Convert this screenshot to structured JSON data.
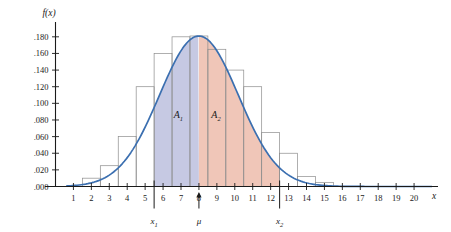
{
  "figure": {
    "y_axis_title": "f(x)",
    "x_axis_title": "x"
  },
  "labels": {
    "area1": "A",
    "area1_sub": "1",
    "area2": "A",
    "area2_sub": "2",
    "x1": "x",
    "x1_sub": "1",
    "mu": "μ",
    "x2": "x",
    "x2_sub": "2"
  },
  "colors": {
    "curve": "#3b6fb0",
    "area1_fill": "#c3c6e2",
    "area2_fill": "#efc3b4",
    "bar_stroke": "#8d8d8d",
    "axis": "#1a1a1a"
  },
  "chart_data": {
    "type": "area",
    "title": "",
    "subtitle": "",
    "xlabel": "x",
    "ylabel": "f(x)",
    "xlim": [
      0,
      21
    ],
    "ylim": [
      0.0,
      0.19
    ],
    "grid": false,
    "legend": null,
    "x_ticks": [
      1,
      2,
      3,
      4,
      5,
      6,
      7,
      8,
      9,
      10,
      11,
      12,
      13,
      14,
      15,
      16,
      17,
      18,
      19,
      20
    ],
    "x_tick_labels": [
      "1",
      "2",
      "3",
      "4",
      "5",
      "6",
      "7",
      "8",
      "9",
      "10",
      "11",
      "12",
      "13",
      "14",
      "15",
      "16",
      "17",
      "18",
      "19",
      "20"
    ],
    "y_ticks": [
      0.0,
      0.02,
      0.04,
      0.06,
      0.08,
      0.1,
      0.12,
      0.14,
      0.16,
      0.18
    ],
    "y_tick_labels": [
      ".000",
      ".020",
      ".040",
      ".060",
      ".080",
      ".100",
      ".120",
      ".140",
      ".160",
      ".180"
    ],
    "series": [
      {
        "name": "normal density curve",
        "type": "line",
        "color": "#3b6fb0",
        "mean": 8.0,
        "sigma": 2.2,
        "peak": 0.181,
        "x": [
          1,
          1.5,
          2,
          2.5,
          3,
          3.5,
          4,
          4.5,
          5,
          5.5,
          6,
          6.5,
          7,
          7.5,
          8,
          8.5,
          9,
          9.5,
          10,
          10.5,
          11,
          11.5,
          12,
          12.5,
          13,
          13.5,
          14,
          14.5,
          15,
          15.5,
          16,
          17,
          18,
          19,
          20
        ],
        "y": [
          0.003,
          0.005,
          0.009,
          0.015,
          0.024,
          0.036,
          0.052,
          0.072,
          0.096,
          0.121,
          0.145,
          0.165,
          0.177,
          0.181,
          0.181,
          0.177,
          0.165,
          0.145,
          0.121,
          0.096,
          0.072,
          0.052,
          0.036,
          0.024,
          0.015,
          0.009,
          0.005,
          0.003,
          0.0015,
          0.0008,
          0.0004,
          0.0001,
          0.0,
          0.0,
          0.0
        ]
      },
      {
        "name": "relative frequency histogram",
        "type": "bar",
        "bin_width": 1.0,
        "bin_left_edges": [
          1.5,
          2.5,
          3.5,
          4.5,
          5.5,
          6.5,
          7.5,
          8.5,
          9.5,
          10.5,
          11.5,
          12.5,
          13.5,
          14.5
        ],
        "bin_centers": [
          2,
          3,
          4,
          5,
          6,
          7,
          8,
          9,
          10,
          11,
          12,
          13,
          14,
          15
        ],
        "values": [
          0.01,
          0.025,
          0.06,
          0.12,
          0.16,
          0.18,
          0.181,
          0.165,
          0.14,
          0.12,
          0.065,
          0.04,
          0.012,
          0.005
        ]
      }
    ],
    "shaded_regions": [
      {
        "label": "A1",
        "from": 5.5,
        "to": 8.0,
        "color": "#c3c6e2"
      },
      {
        "label": "A2",
        "from": 8.0,
        "to": 12.5,
        "color": "#efc3b4"
      }
    ],
    "annotations": [
      {
        "name": "x1",
        "text": "x₁",
        "x": 5.5,
        "kind": "axis-marker-down"
      },
      {
        "name": "mu",
        "text": "μ",
        "x": 8.0,
        "kind": "axis-marker-up-arrow"
      },
      {
        "name": "x2",
        "text": "x₂",
        "x": 12.5,
        "kind": "axis-marker-down"
      }
    ]
  }
}
